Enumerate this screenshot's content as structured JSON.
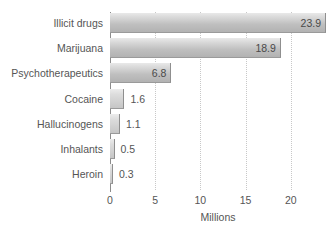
{
  "chart_data": {
    "type": "bar",
    "orientation": "horizontal",
    "title": "",
    "xlabel": "Millions",
    "ylabel": "",
    "xlim": [
      0,
      23.9
    ],
    "xticks": [
      0,
      5,
      10,
      15,
      20
    ],
    "grid": true,
    "legend": false,
    "categories": [
      "Illicit drugs",
      "Marijuana",
      "Psychotherapeutics",
      "Cocaine",
      "Hallucinogens",
      "Inhalants",
      "Heroin"
    ],
    "values": [
      23.9,
      18.9,
      6.8,
      1.6,
      1.1,
      0.5,
      0.3
    ],
    "value_labels": [
      "23.9",
      "18.9",
      "6.8",
      "1.6",
      "1.1",
      "0.5",
      "0.3"
    ],
    "label_placement": [
      "inside",
      "inside",
      "inside",
      "outside",
      "outside",
      "outside",
      "outside"
    ]
  },
  "colors": {
    "bar_light": "#e9e9e9",
    "bar_dark": "#b2b2b2",
    "axis": "#8c8c8c",
    "grid": "#c8c8c8",
    "text": "#555555",
    "background": "#ffffff"
  }
}
